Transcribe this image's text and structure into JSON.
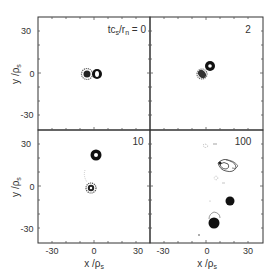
{
  "figure": {
    "panels": [
      {
        "id": "p0",
        "label": "tc_s/r_n = 0",
        "time": "0",
        "title_text": "tcs/rn = 0"
      },
      {
        "id": "p2",
        "label": "2",
        "time": "2"
      },
      {
        "id": "p10",
        "label": "10",
        "time": "10"
      },
      {
        "id": "p100",
        "label": "100",
        "time": "100"
      }
    ],
    "axes": {
      "xlabel": "x / ρs",
      "ylabel": "y / ρs",
      "x_ticks": [
        "-30",
        "0",
        "30"
      ],
      "y_ticks": [
        "30",
        "0",
        "-30"
      ],
      "range": [
        -40,
        40
      ]
    },
    "title_prefix": "tc",
    "title_sub1": "s",
    "title_mid": "/r",
    "title_sub2": "n",
    "title_suffix": " = 0",
    "xlabel_main": "x /ρ",
    "xlabel_sub": "s",
    "ylabel_main": "y /ρ",
    "ylabel_sub": "s",
    "tick_30": "30",
    "tick_0": "0",
    "tick_m30": "-30",
    "label_2": "2",
    "label_10": "10",
    "label_100": "100"
  }
}
